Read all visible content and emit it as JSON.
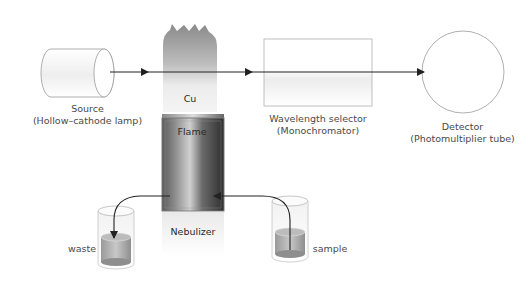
{
  "diagram": {
    "components": {
      "source": {
        "label": "Source",
        "sublabel": "(Hollow–cathode lamp)"
      },
      "flame": {
        "element_label": "Cu",
        "label": "Flame"
      },
      "nebulizer": {
        "label": "Nebulizer"
      },
      "wavelength_selector": {
        "label": "Wavelength selector",
        "sublabel": "(Monochromator)"
      },
      "detector": {
        "label": "Detector",
        "sublabel": "(Photomultiplier tube)"
      },
      "waste": {
        "label": "waste"
      },
      "sample": {
        "label": "sample"
      }
    },
    "colors": {
      "line": "#222222",
      "outline": "#aaaaaa",
      "flame_top": "#8c8c8c",
      "flame_bottom": "#f2f2f2",
      "nebulizer_dark": "#3a3a3a",
      "nebulizer_light": "#b5b5b5",
      "liquid": "#a0a0a0"
    }
  }
}
